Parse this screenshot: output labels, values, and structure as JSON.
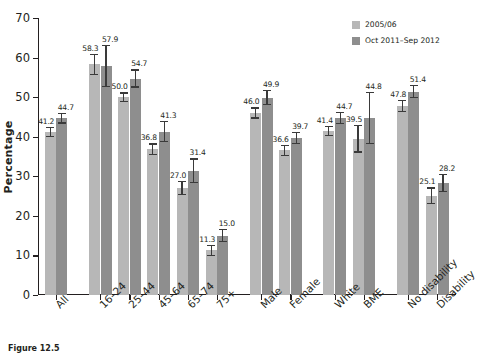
{
  "chart_data": {
    "type": "bar",
    "title": "",
    "xlabel": "",
    "ylabel": "Percentage",
    "ylim": [
      0,
      70
    ],
    "yticks": [
      0,
      10,
      20,
      30,
      40,
      50,
      60,
      70
    ],
    "grid": false,
    "legend_position": "top-right",
    "categories": [
      "All",
      "16–24",
      "25–44",
      "45–64",
      "65–74",
      "75+",
      "Male",
      "Female",
      "White",
      "BME",
      "No disability",
      "Disability"
    ],
    "group_breaks_after": [
      "All",
      "75+",
      "Female",
      "BME"
    ],
    "series": [
      {
        "name": "2005/06",
        "color": "#b7b7b7",
        "values": [
          41.2,
          58.3,
          50.0,
          36.8,
          27.0,
          11.3,
          46.0,
          36.6,
          41.4,
          39.5,
          47.8,
          25.1
        ],
        "err_low": [
          39.9,
          55.6,
          48.8,
          35.3,
          25.2,
          9.9,
          44.6,
          35.2,
          40.1,
          36.0,
          46.3,
          23.0
        ],
        "err_high": [
          42.5,
          60.9,
          51.2,
          38.3,
          28.8,
          12.7,
          47.4,
          38.0,
          42.7,
          43.0,
          49.3,
          27.2
        ]
      },
      {
        "name": "Oct 2011–Sep 2012",
        "color": "#8e8e8e",
        "values": [
          44.7,
          57.9,
          54.7,
          41.3,
          31.4,
          15.0,
          49.9,
          39.7,
          44.7,
          44.8,
          51.4,
          28.2
        ],
        "err_low": [
          43.3,
          52.6,
          52.4,
          38.6,
          28.3,
          13.4,
          47.9,
          38.1,
          43.2,
          38.2,
          49.8,
          25.9
        ],
        "err_high": [
          46.1,
          63.2,
          57.0,
          44.0,
          34.5,
          16.6,
          51.9,
          41.3,
          46.2,
          51.4,
          53.0,
          30.5
        ]
      }
    ],
    "data_labels": {
      "series_0": [
        "41.2",
        "58.3",
        "50.0",
        "36.8",
        "27.0",
        "11.3",
        "46.0",
        "36.6",
        "41.4",
        "39.5",
        "47.8",
        "25.1"
      ],
      "series_1": [
        "44.7",
        "57.9",
        "54.7",
        "41.3",
        "31.4",
        "15.0",
        "49.9",
        "39.7",
        "44.7",
        "44.8",
        "51.4",
        "28.2"
      ]
    }
  },
  "legend": {
    "items": [
      {
        "label": "2005/06"
      },
      {
        "label": "Oct 2011–Sep 2012"
      }
    ]
  },
  "caption": {
    "figure_number": "Figure 12.5",
    "text": ""
  }
}
